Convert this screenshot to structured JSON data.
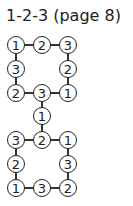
{
  "title": "1-2-3 (page 8)",
  "puzzle": {
    "nodes": [
      {
        "id": "a1",
        "value": "1",
        "x": 16,
        "y": 45
      },
      {
        "id": "a2",
        "value": "2",
        "x": 42,
        "y": 45
      },
      {
        "id": "a3",
        "value": "3",
        "x": 68,
        "y": 45
      },
      {
        "id": "b1",
        "value": "3",
        "x": 16,
        "y": 69
      },
      {
        "id": "b3",
        "value": "2",
        "x": 68,
        "y": 69
      },
      {
        "id": "c1",
        "value": "2",
        "x": 16,
        "y": 93
      },
      {
        "id": "c2",
        "value": "3",
        "x": 42,
        "y": 93
      },
      {
        "id": "c3",
        "value": "1",
        "x": 68,
        "y": 93
      },
      {
        "id": "d2",
        "value": "1",
        "x": 42,
        "y": 116
      },
      {
        "id": "e1",
        "value": "3",
        "x": 16,
        "y": 140
      },
      {
        "id": "e2",
        "value": "2",
        "x": 42,
        "y": 140
      },
      {
        "id": "e3",
        "value": "1",
        "x": 68,
        "y": 140
      },
      {
        "id": "f1",
        "value": "2",
        "x": 16,
        "y": 164
      },
      {
        "id": "f3",
        "value": "3",
        "x": 68,
        "y": 164
      },
      {
        "id": "g1",
        "value": "1",
        "x": 16,
        "y": 188
      },
      {
        "id": "g2",
        "value": "3",
        "x": 42,
        "y": 188
      },
      {
        "id": "g3",
        "value": "2",
        "x": 68,
        "y": 188
      }
    ]
  }
}
